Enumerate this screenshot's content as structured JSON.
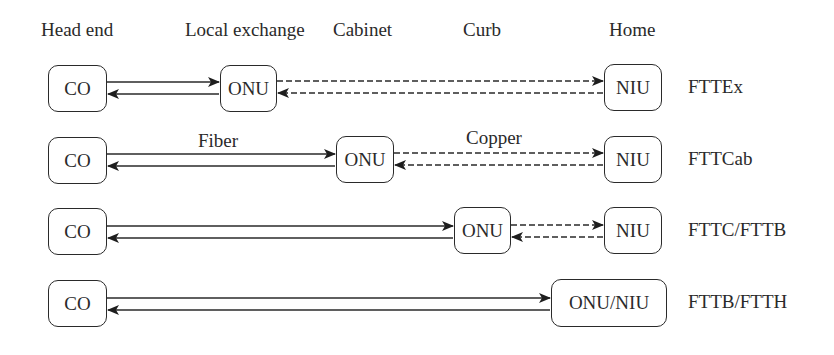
{
  "headers": {
    "head_end": "Head end",
    "local_exchange": "Local exchange",
    "cabinet": "Cabinet",
    "curb": "Curb",
    "home": "Home"
  },
  "media": {
    "fiber": "Fiber",
    "copper": "Copper"
  },
  "rows": [
    {
      "label": "FTTEx",
      "co": "CO",
      "onu": "ONU",
      "niu": "NIU",
      "onu_location": "Local exchange"
    },
    {
      "label": "FTTCab",
      "co": "CO",
      "onu": "ONU",
      "niu": "NIU",
      "onu_location": "Cabinet"
    },
    {
      "label": "FTTC/FTTB",
      "co": "CO",
      "onu": "ONU",
      "niu": "NIU",
      "onu_location": "Curb"
    },
    {
      "label": "FTTB/FTTH",
      "co": "CO",
      "onu_niu": "ONU/NIU",
      "onu_location": "Home"
    }
  ],
  "legend": {
    "solid_line": "Fiber",
    "dashed_line": "Copper"
  },
  "colors": {
    "stroke": "#2a2a2a",
    "background": "#ffffff"
  }
}
